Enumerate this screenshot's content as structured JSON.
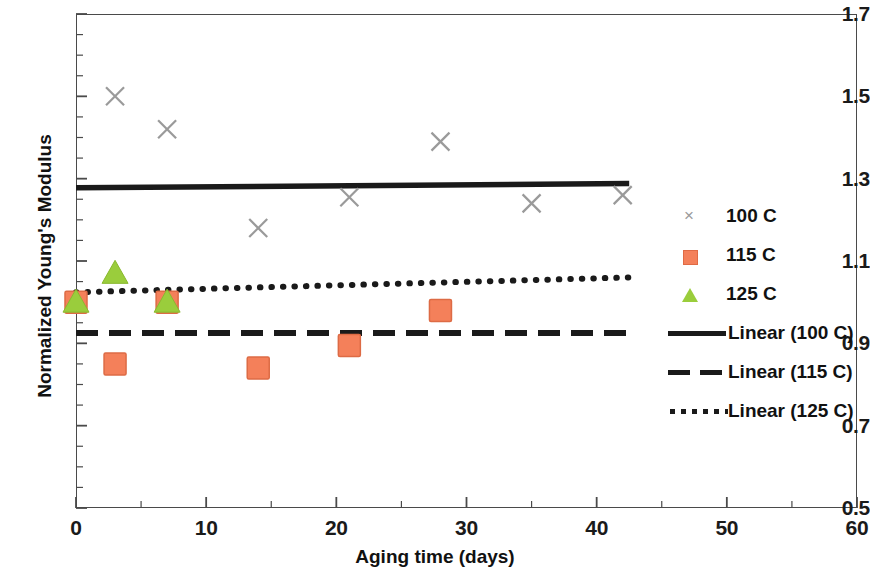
{
  "chart_data": {
    "type": "scatter",
    "title": "",
    "xlabel": "Aging time (days)",
    "ylabel": "Normalized Young's Modulus",
    "xlim": [
      0,
      60
    ],
    "ylim": [
      0.5,
      1.7
    ],
    "x_major_step": 10,
    "x_minor_step": 5,
    "y_major_step": 0.2,
    "y_minor_step": 0.05,
    "grid": false,
    "legend_position": "right",
    "x_tick_labels": [
      "0",
      "10",
      "20",
      "30",
      "40",
      "50",
      "60"
    ],
    "x_tick_values": [
      0,
      10,
      20,
      30,
      40,
      50,
      60
    ],
    "y_tick_labels": [
      "0.5",
      "0.7",
      "0.9",
      "1.1",
      "1.3",
      "1.5",
      "1.7"
    ],
    "y_tick_values": [
      0.5,
      0.7,
      0.9,
      1.1,
      1.3,
      1.5,
      1.7
    ],
    "series": [
      {
        "name": "100 C",
        "marker": "x",
        "color": "#9a9a9a",
        "x": [
          3,
          7,
          14,
          21,
          28,
          35,
          42
        ],
        "values": [
          1.5,
          1.42,
          1.18,
          1.255,
          1.39,
          1.24,
          1.26
        ]
      },
      {
        "name": "115 C",
        "marker": "square",
        "color": "#f4805a",
        "x": [
          0,
          3,
          7,
          14,
          21,
          28
        ],
        "values": [
          1.0,
          0.85,
          1.0,
          0.84,
          0.895,
          0.98
        ]
      },
      {
        "name": "125 C",
        "marker": "triangle",
        "color": "#9acd3c",
        "x": [
          0,
          3,
          7
        ],
        "values": [
          1.0,
          1.07,
          1.0
        ]
      }
    ],
    "trendlines": [
      {
        "name": "Linear (100 C)",
        "style": "solid",
        "color": "#1a1a1a",
        "x_start": 0,
        "x_end": 42.5,
        "y_start": 1.278,
        "y_end": 1.288
      },
      {
        "name": "Linear (115 C)",
        "style": "dashed",
        "color": "#1a1a1a",
        "x_start": 0,
        "x_end": 42.5,
        "y_start": 0.925,
        "y_end": 0.925
      },
      {
        "name": "Linear (125 C)",
        "style": "dotted",
        "color": "#1a1a1a",
        "x_start": 0,
        "x_end": 42.5,
        "y_start": 1.024,
        "y_end": 1.06
      }
    ],
    "legend_entries": [
      {
        "label": "100 C",
        "key": "x-marker"
      },
      {
        "label": "115 C",
        "key": "square-marker"
      },
      {
        "label": "125 C",
        "key": "triangle-marker"
      },
      {
        "label": "Linear (100 C)",
        "key": "solid-line"
      },
      {
        "label": "Linear (115 C)",
        "key": "dashed-line"
      },
      {
        "label": "Linear (125 C)",
        "key": "dotted-line"
      }
    ]
  }
}
